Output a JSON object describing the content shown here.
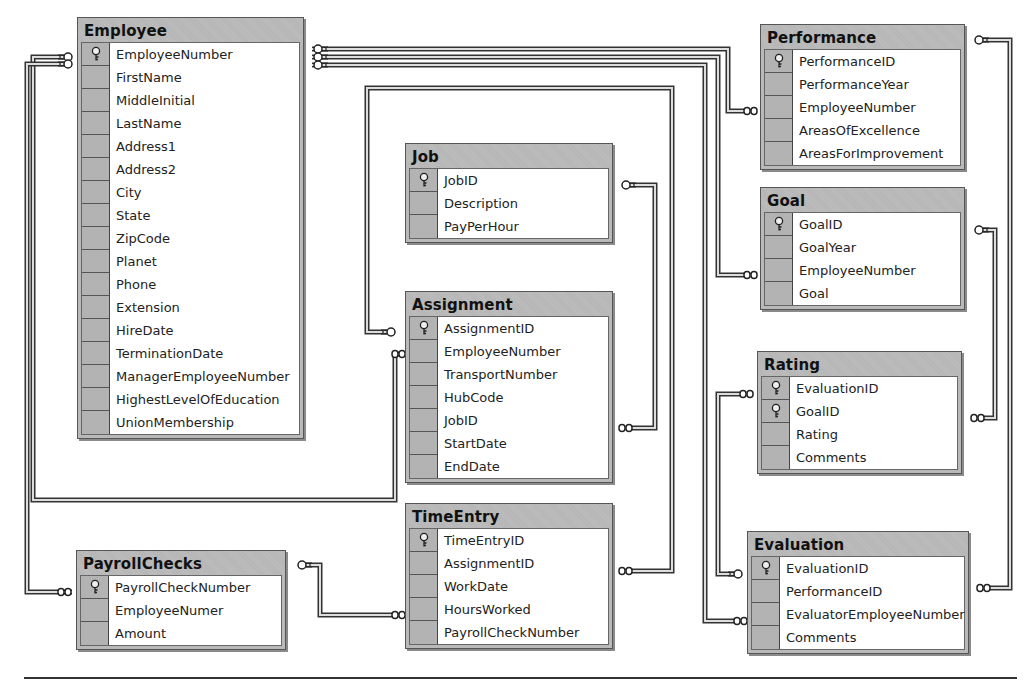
{
  "diagram": {
    "type": "database-entity-relationship",
    "tables": {
      "employee": {
        "title": "Employee",
        "fields": [
          "EmployeeNumber",
          "FirstName",
          "MiddleInitial",
          "LastName",
          "Address1",
          "Address2",
          "City",
          "State",
          "ZipCode",
          "Planet",
          "Phone",
          "Extension",
          "HireDate",
          "TerminationDate",
          "ManagerEmployeeNumber",
          "HighestLevelOfEducation",
          "UnionMembership"
        ],
        "keys": [
          0
        ]
      },
      "performance": {
        "title": "Performance",
        "fields": [
          "PerformanceID",
          "PerformanceYear",
          "EmployeeNumber",
          "AreasOfExcellence",
          "AreasForImprovement"
        ],
        "keys": [
          0
        ]
      },
      "job": {
        "title": "Job",
        "fields": [
          "JobID",
          "Description",
          "PayPerHour"
        ],
        "keys": [
          0
        ]
      },
      "goal": {
        "title": "Goal",
        "fields": [
          "GoalID",
          "GoalYear",
          "EmployeeNumber",
          "Goal"
        ],
        "keys": [
          0
        ]
      },
      "assignment": {
        "title": "Assignment",
        "fields": [
          "AssignmentID",
          "EmployeeNumber",
          "TransportNumber",
          "HubCode",
          "JobID",
          "StartDate",
          "EndDate"
        ],
        "keys": [
          0
        ]
      },
      "rating": {
        "title": "Rating",
        "fields": [
          "EvaluationID",
          "GoalID",
          "Rating",
          "Comments"
        ],
        "keys": [
          0,
          1
        ]
      },
      "timeentry": {
        "title": "TimeEntry",
        "fields": [
          "TimeEntryID",
          "AssignmentID",
          "WorkDate",
          "HoursWorked",
          "PayrollCheckNumber"
        ],
        "keys": [
          0
        ]
      },
      "payrollchecks": {
        "title": "PayrollChecks",
        "fields": [
          "PayrollCheckNumber",
          "EmployeeNumer",
          "Amount"
        ],
        "keys": [
          0
        ]
      },
      "evaluation": {
        "title": "Evaluation",
        "fields": [
          "EvaluationID",
          "PerformanceID",
          "EvaluatorEmployeeNumber",
          "Comments"
        ],
        "keys": [
          0
        ]
      }
    },
    "relationships": [
      {
        "from": "Employee",
        "to": "Performance",
        "type": "one-to-many"
      },
      {
        "from": "Employee",
        "to": "Goal",
        "type": "one-to-many"
      },
      {
        "from": "Employee",
        "to": "Evaluation",
        "type": "one-to-many"
      },
      {
        "from": "Employee",
        "to": "Assignment",
        "type": "one-to-many"
      },
      {
        "from": "Employee",
        "to": "PayrollChecks",
        "type": "one-to-many"
      },
      {
        "from": "Job",
        "to": "Assignment",
        "type": "one-to-many"
      },
      {
        "from": "Assignment",
        "to": "TimeEntry",
        "type": "one-to-many"
      },
      {
        "from": "PayrollChecks",
        "to": "TimeEntry",
        "type": "one-to-many"
      },
      {
        "from": "Performance",
        "to": "Evaluation",
        "type": "one-to-many"
      },
      {
        "from": "Goal",
        "to": "Rating",
        "type": "one-to-many"
      },
      {
        "from": "Evaluation",
        "to": "Rating",
        "type": "one-to-many"
      }
    ]
  }
}
